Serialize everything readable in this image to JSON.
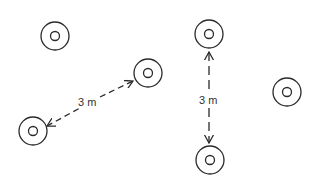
{
  "diagram": {
    "colors": {
      "stroke": "#2a2a2a",
      "background": "#ffffff",
      "text": "#333333"
    },
    "markers": [
      {
        "id": "marker-1",
        "cx": 55,
        "cy": 36
      },
      {
        "id": "marker-2",
        "cx": 148,
        "cy": 73
      },
      {
        "id": "marker-3",
        "cx": 33,
        "cy": 131
      },
      {
        "id": "marker-4",
        "cx": 209,
        "cy": 34
      },
      {
        "id": "marker-5",
        "cx": 210,
        "cy": 160
      },
      {
        "id": "marker-6",
        "cx": 287,
        "cy": 92
      }
    ],
    "dimensions": [
      {
        "id": "diagonal-distance",
        "label": "3 m",
        "from": "marker-3",
        "to": "marker-2"
      },
      {
        "id": "vertical-distance",
        "label": "3 m",
        "from": "marker-4",
        "to": "marker-5"
      }
    ]
  }
}
